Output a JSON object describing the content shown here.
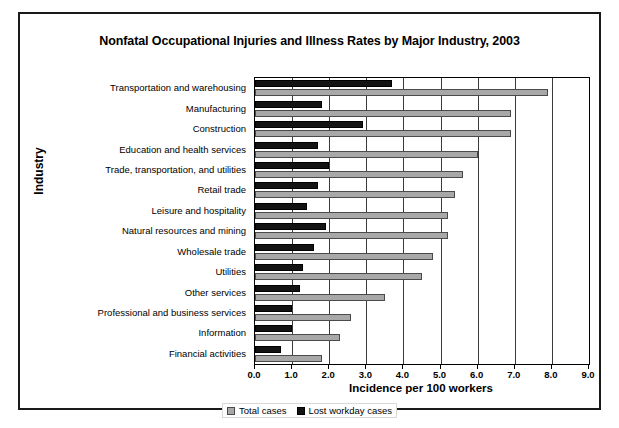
{
  "chart_data": {
    "type": "bar",
    "orientation": "horizontal",
    "title": "Nonfatal Occupational Injuries and Illness Rates by Major Industry, 2003",
    "xlabel": "Incidence per 100 workers",
    "ylabel": "Industry",
    "xlim": [
      0.0,
      9.0
    ],
    "xtick_step": 1.0,
    "xticks": [
      "0.0",
      "1.0",
      "2.0",
      "3.0",
      "4.0",
      "5.0",
      "6.0",
      "7.0",
      "8.0",
      "9.0"
    ],
    "grid": "vertical",
    "legend_position": "bottom-center",
    "categories": [
      "Transportation and warehousing",
      "Manufacturing",
      "Construction",
      "Education and health services",
      "Trade, transportation, and utilities",
      "Retail trade",
      "Leisure and hospitality",
      "Natural resources and mining",
      "Wholesale trade",
      "Utilities",
      "Other services",
      "Professional and business services",
      "Information",
      "Financial activities"
    ],
    "series": [
      {
        "name": "Total cases",
        "color": "#a8a8a8",
        "values": [
          7.9,
          6.9,
          6.9,
          6.0,
          5.6,
          5.4,
          5.2,
          5.2,
          4.8,
          4.5,
          3.5,
          2.6,
          2.3,
          1.8
        ]
      },
      {
        "name": "Lost workday cases",
        "color": "#131313",
        "values": [
          3.7,
          1.8,
          2.9,
          1.7,
          2.0,
          1.7,
          1.4,
          1.9,
          1.6,
          1.3,
          1.2,
          1.0,
          1.0,
          0.7
        ]
      }
    ]
  }
}
